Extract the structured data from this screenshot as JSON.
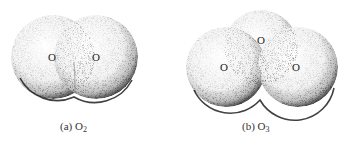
{
  "figure": {
    "panels": [
      {
        "id": "a",
        "caption_prefix": "(a)",
        "formula_base": "O",
        "formula_subscript": "2",
        "atoms": [
          "O",
          "O"
        ]
      },
      {
        "id": "b",
        "caption_prefix": "(b)",
        "formula_base": "O",
        "formula_subscript": "3",
        "atoms": [
          "O",
          "O",
          "O"
        ]
      }
    ],
    "colors": {
      "surface": "#f4f4f4",
      "shade": "#1a1a1a",
      "text": "#222222"
    }
  }
}
